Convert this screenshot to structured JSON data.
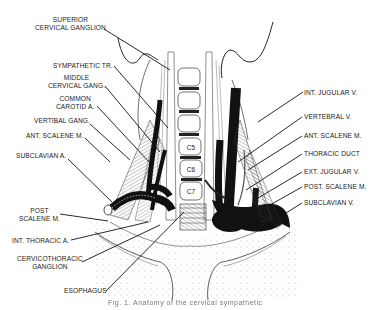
{
  "diagram": {
    "vertebrae": [
      "C5",
      "C6",
      "C7"
    ],
    "labels_left": [
      {
        "id": "superior-cervical-ganglion",
        "line1": "SUPERIOR",
        "line2": "CERVICAL GANGLION"
      },
      {
        "id": "sympathetic-tr",
        "line1": "SYMPATHETIC TR."
      },
      {
        "id": "middle-cervical-gang",
        "line1": "MIDDLE",
        "line2": "CERVICAL GANG."
      },
      {
        "id": "common-carotid-a",
        "line1": "COMMON",
        "line2": "CAROTID A."
      },
      {
        "id": "vertibal-gang",
        "line1": "VERTIBAL GANG."
      },
      {
        "id": "ant-scalene-m-left",
        "line1": "ANT. SCALENE M."
      },
      {
        "id": "subclavian-a",
        "line1": "SUBCLAVIAN A."
      },
      {
        "id": "post-scalene-m-left",
        "line1": "POST",
        "line2": "SCALENE M."
      },
      {
        "id": "int-thoracic-a",
        "line1": "INT. THORACIC A."
      },
      {
        "id": "cervicothoracic-ganglion",
        "line1": "CERVICOTHORACIC",
        "line2": "GANGLION"
      },
      {
        "id": "esophagus",
        "line1": "ESOPHAGUS"
      }
    ],
    "labels_right": [
      {
        "id": "int-jugular-v",
        "line1": "INT. JUGULAR V."
      },
      {
        "id": "vertebral-v",
        "line1": "VERTEBRAL V."
      },
      {
        "id": "ant-scalene-m-right",
        "line1": "ANT. SCALENE M."
      },
      {
        "id": "thoracic-duct",
        "line1": "THORACIC DUCT"
      },
      {
        "id": "ext-jugular-v",
        "line1": "EXT. JUGULAR V."
      },
      {
        "id": "post-scalene-m-right",
        "line1": "POST. SCALENE M."
      },
      {
        "id": "subclavian-v",
        "line1": "SUBCLAVIAN V."
      }
    ],
    "caption": "Fig. 1. Anatomy of the cervical sympathetic"
  }
}
